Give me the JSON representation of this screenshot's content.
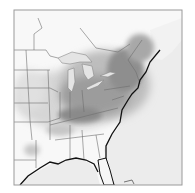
{
  "map": {
    "region": "Eastern United States",
    "style": "grayscale intensity field",
    "frame": {
      "x": 14,
      "y": 10,
      "width": 168,
      "height": 175,
      "stroke": "#9a9a9a"
    },
    "colors": {
      "background": "#ffffff",
      "ocean": "#e9e9e9",
      "land": "#f7f7f7",
      "state_border": "#6e6e6e",
      "coastline": "#111111",
      "intensity_low": "#dcdcdc",
      "intensity_mid": "#a6a6a6",
      "intensity_high": "#6a6a6a",
      "lakes": "#e6e6e6"
    },
    "legend": null,
    "labels": []
  }
}
